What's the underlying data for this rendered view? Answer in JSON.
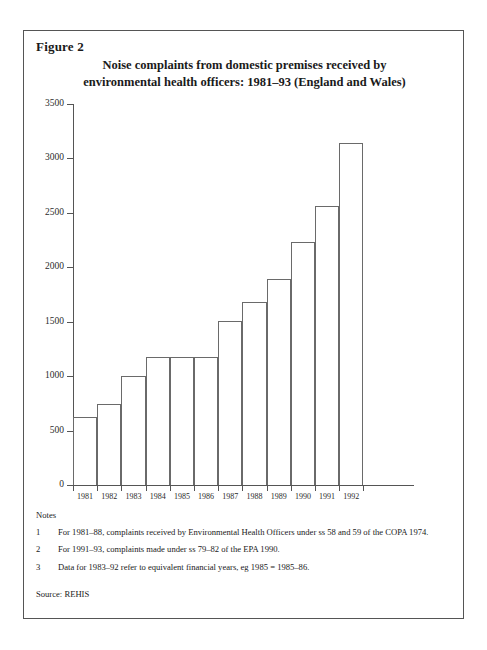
{
  "figure": {
    "label": "Figure 2",
    "title_line1": "Noise complaints from domestic premises received by",
    "title_line2": "environmental health officers: 1981–93 (England and Wales)"
  },
  "notes": {
    "heading": "Notes",
    "items": [
      {
        "num": "1",
        "text": "For 1981–88, complaints received by Environmental Health Officers under  ss 58 and 59 of the COPA 1974."
      },
      {
        "num": "2",
        "text": "For 1991–93, complaints made under ss 79–82 of the EPA 1990."
      },
      {
        "num": "3",
        "text": "Data for 1983–92 refer to equivalent financial years, eg 1985 = 1985–86."
      }
    ],
    "source": "Source: REHIS"
  },
  "chart_data": {
    "type": "bar",
    "title": "Noise complaints from domestic premises received by environmental health officers: 1981–93 (England and Wales)",
    "xlabel": "",
    "ylabel": "",
    "categories": [
      "1981",
      "1982",
      "1983",
      "1984",
      "1985",
      "1986",
      "1987",
      "1988",
      "1989",
      "1990",
      "1991",
      "1992"
    ],
    "values": [
      625,
      740,
      1000,
      1180,
      1180,
      1180,
      1510,
      1680,
      1890,
      2230,
      2560,
      3140
    ],
    "ylim": [
      0,
      3500
    ],
    "yticks": [
      0,
      500,
      1000,
      1500,
      2000,
      2500,
      3000,
      3500
    ],
    "ytick_labels": [
      "0",
      "500",
      "1000",
      "1500",
      "2000",
      "2500",
      "3000",
      "3500"
    ],
    "grid": false,
    "legend": false,
    "bar_style": {
      "fill": "none",
      "edge": "#6a6a6a"
    }
  }
}
